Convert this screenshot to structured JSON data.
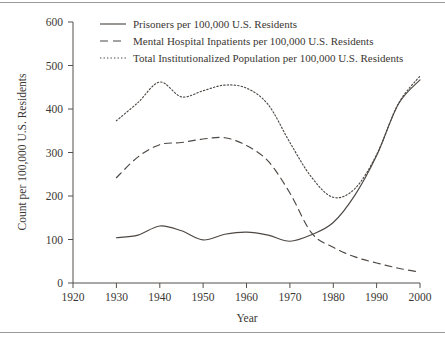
{
  "chart_data": {
    "type": "line",
    "title": "",
    "xlabel": "Year",
    "ylabel": "Count per 100,000 U.S. Residents",
    "xlim": [
      1920,
      2000
    ],
    "ylim": [
      0,
      600
    ],
    "xticks": [
      1920,
      1930,
      1940,
      1950,
      1960,
      1970,
      1980,
      1990,
      2000
    ],
    "yticks": [
      0,
      100,
      200,
      300,
      400,
      500,
      600
    ],
    "grid": false,
    "legend_position": "top-center",
    "x": [
      1930,
      1935,
      1940,
      1945,
      1950,
      1955,
      1960,
      1965,
      1970,
      1975,
      1980,
      1985,
      1990,
      1995,
      2000
    ],
    "series": [
      {
        "name": "Prisoners per 100,000 U.S. Residents",
        "style": "solid",
        "values": [
          104,
          110,
          131,
          120,
          99,
          112,
          117,
          110,
          96,
          111,
          139,
          202,
          293,
          411,
          467
        ]
      },
      {
        "name": "Mental Hospital Inpatients per 100,000 U.S. Residents",
        "style": "dashed",
        "values": [
          242,
          290,
          318,
          323,
          331,
          334,
          316,
          280,
          207,
          115,
          82,
          60,
          46,
          34,
          25
        ]
      },
      {
        "name": "Total Institutionalized Population per 100,000 U.S. Residents",
        "style": "dotted",
        "values": [
          373,
          415,
          462,
          428,
          442,
          455,
          448,
          410,
          323,
          243,
          197,
          217,
          295,
          412,
          476
        ]
      }
    ]
  },
  "legend": {
    "entries": [
      {
        "label": "Prisoners per 100,000 U.S. Residents",
        "style": "solid"
      },
      {
        "label": "Mental Hospital Inpatients per 100,000 U.S. Residents",
        "style": "dashed"
      },
      {
        "label": "Total Institutionalized Population per 100,000 U.S. Residents",
        "style": "dotted"
      }
    ]
  },
  "axes": {
    "y_title": "Count per 100,000 U.S. Residents",
    "x_title": "Year",
    "y_labels": [
      "600",
      "500",
      "400",
      "300",
      "200",
      "100",
      "0"
    ],
    "x_labels": [
      "1920",
      "1930",
      "1940",
      "1950",
      "1960",
      "1970",
      "1980",
      "1990",
      "2000"
    ]
  },
  "colors": {
    "ink": "#4d4844",
    "paper": "#ffffff",
    "rule": "#9b9b9b"
  }
}
